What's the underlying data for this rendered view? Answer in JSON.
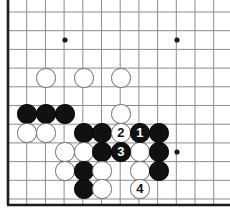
{
  "diagram": {
    "kind": "go-board",
    "board_pixel_width": 230,
    "board_pixel_height": 214,
    "background_color": "#ffffff",
    "line_color": "#8c8c8c",
    "edge_color": "#1a1a1a",
    "black_color": "#111111",
    "white_color": "#ffffff",
    "white_border_color": "#6b6b6b",
    "stone_radius": 9.6,
    "grid": {
      "origin_x": 8,
      "origin_y": 12,
      "pitch_x": 18.7,
      "pitch_y": 18.7,
      "columns": 12,
      "rows": 11,
      "visible_left_edge": true,
      "visible_bottom_edge": true,
      "visible_top_edge": false,
      "visible_right_edge": false
    },
    "star_points": [
      {
        "col": 3,
        "row": 1.5
      },
      {
        "col": 9,
        "row": 1.5
      },
      {
        "col": 9,
        "row": 7.5
      }
    ],
    "star_points_px": [
      {
        "x": 65,
        "y": 40
      },
      {
        "x": 177,
        "y": 40
      },
      {
        "x": 177,
        "y": 152
      }
    ],
    "stones": [
      {
        "color": "white",
        "x": 46,
        "y": 78,
        "label": ""
      },
      {
        "color": "white",
        "x": 84,
        "y": 78,
        "label": ""
      },
      {
        "color": "white",
        "x": 121,
        "y": 78,
        "label": ""
      },
      {
        "color": "black",
        "x": 27,
        "y": 114,
        "label": ""
      },
      {
        "color": "black",
        "x": 46,
        "y": 114,
        "label": ""
      },
      {
        "color": "black",
        "x": 65,
        "y": 114,
        "label": ""
      },
      {
        "color": "white",
        "x": 121,
        "y": 114,
        "label": ""
      },
      {
        "color": "white",
        "x": 27,
        "y": 133,
        "label": ""
      },
      {
        "color": "white",
        "x": 46,
        "y": 133,
        "label": ""
      },
      {
        "color": "black",
        "x": 84,
        "y": 133,
        "label": ""
      },
      {
        "color": "black",
        "x": 102,
        "y": 133,
        "label": ""
      },
      {
        "color": "white",
        "x": 121,
        "y": 133,
        "label": "2"
      },
      {
        "color": "black",
        "x": 140,
        "y": 133,
        "label": "1"
      },
      {
        "color": "black",
        "x": 159,
        "y": 133,
        "label": ""
      },
      {
        "color": "white",
        "x": 65,
        "y": 152,
        "label": ""
      },
      {
        "color": "white",
        "x": 84,
        "y": 152,
        "label": ""
      },
      {
        "color": "black",
        "x": 102,
        "y": 152,
        "label": ""
      },
      {
        "color": "black",
        "x": 121,
        "y": 152,
        "label": "3"
      },
      {
        "color": "white",
        "x": 140,
        "y": 152,
        "label": ""
      },
      {
        "color": "black",
        "x": 159,
        "y": 152,
        "label": ""
      },
      {
        "color": "white",
        "x": 65,
        "y": 171,
        "label": ""
      },
      {
        "color": "black",
        "x": 84,
        "y": 171,
        "label": ""
      },
      {
        "color": "white",
        "x": 102,
        "y": 171,
        "label": ""
      },
      {
        "color": "white",
        "x": 140,
        "y": 171,
        "label": ""
      },
      {
        "color": "black",
        "x": 159,
        "y": 171,
        "label": ""
      },
      {
        "color": "black",
        "x": 84,
        "y": 189,
        "label": ""
      },
      {
        "color": "white",
        "x": 102,
        "y": 189,
        "label": ""
      },
      {
        "color": "white",
        "x": 140,
        "y": 189,
        "label": "4"
      }
    ],
    "move_sequence": [
      {
        "number": "1",
        "color": "black",
        "x": 140,
        "y": 133
      },
      {
        "number": "2",
        "color": "white",
        "x": 121,
        "y": 133
      },
      {
        "number": "3",
        "color": "black",
        "x": 121,
        "y": 152
      },
      {
        "number": "4",
        "color": "white",
        "x": 140,
        "y": 189
      }
    ]
  }
}
